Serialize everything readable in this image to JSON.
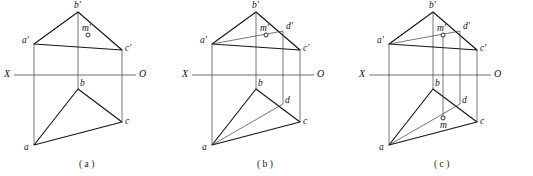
{
  "figure": {
    "background_color": "#ffffff",
    "edge_color": "#161616",
    "projection_line_color": "#4a4a4a",
    "axis_color": "#6f6f6f",
    "width": 533,
    "height": 176
  },
  "axis": {
    "left_label": "X",
    "right_label": "O",
    "y": 75
  },
  "panels": [
    {
      "id": "a",
      "caption": "( a )",
      "caption_x": 79,
      "caption_y": 160,
      "origin_x": 0,
      "axis_x1": 14,
      "axis_x2": 136,
      "axis_left_label_x": 4,
      "axis_right_label_x": 139,
      "vertices": {
        "b_prime": {
          "label": "b'",
          "x": 78,
          "y": 12,
          "lx": 74,
          "ly": 1
        },
        "a_prime": {
          "label": "a'",
          "x": 34,
          "y": 44,
          "lx": 22,
          "ly": 36
        },
        "c_prime": {
          "label": "c'",
          "x": 122,
          "y": 50,
          "lx": 125,
          "ly": 44
        },
        "b": {
          "label": "b",
          "x": 78,
          "y": 89,
          "lx": 80,
          "ly": 79
        },
        "a": {
          "label": "a",
          "x": 34,
          "y": 145,
          "lx": 24,
          "ly": 143
        },
        "c": {
          "label": "c",
          "x": 122,
          "y": 122,
          "lx": 125,
          "ly": 117
        }
      },
      "extra_points": {
        "m_prime": {
          "label": "m'",
          "x": 88,
          "y": 35,
          "r": 2.0,
          "lx": 82,
          "ly": 24
        }
      },
      "has_d": false,
      "has_m_lower": false,
      "has_ad_line": false,
      "has_m_projector": false
    },
    {
      "id": "b",
      "caption": "( b )",
      "caption_x": 257,
      "caption_y": 160,
      "origin_x": 178,
      "axis_x1": 14,
      "axis_x2": 136,
      "axis_left_label_x": 4,
      "axis_right_label_x": 139,
      "vertices": {
        "b_prime": {
          "label": "b'",
          "x": 78,
          "y": 12,
          "lx": 74,
          "ly": 1
        },
        "a_prime": {
          "label": "a'",
          "x": 34,
          "y": 44,
          "lx": 22,
          "ly": 36
        },
        "c_prime": {
          "label": "c'",
          "x": 122,
          "y": 50,
          "lx": 125,
          "ly": 44
        },
        "b": {
          "label": "b",
          "x": 78,
          "y": 89,
          "lx": 80,
          "ly": 79
        },
        "a": {
          "label": "a",
          "x": 34,
          "y": 145,
          "lx": 24,
          "ly": 143
        },
        "c": {
          "label": "c",
          "x": 122,
          "y": 122,
          "lx": 125,
          "ly": 117
        }
      },
      "extra_points": {
        "m_prime": {
          "label": "m'",
          "x": 88,
          "y": 35,
          "r": 2.0,
          "lx": 82,
          "ly": 24
        },
        "d_prime": {
          "label": "d'",
          "x": 105,
          "y": 31,
          "lx": 108,
          "ly": 22
        },
        "d": {
          "label": "d",
          "x": 105,
          "y": 104,
          "lx": 107,
          "ly": 96
        }
      },
      "has_d": true,
      "has_m_lower": false,
      "has_ad_line": true,
      "has_m_projector": false
    },
    {
      "id": "c",
      "caption": "( c )",
      "caption_x": 434,
      "caption_y": 160,
      "origin_x": 355,
      "axis_x1": 14,
      "axis_x2": 136,
      "axis_left_label_x": 4,
      "axis_right_label_x": 139,
      "vertices": {
        "b_prime": {
          "label": "b'",
          "x": 78,
          "y": 12,
          "lx": 74,
          "ly": 1
        },
        "a_prime": {
          "label": "a'",
          "x": 34,
          "y": 44,
          "lx": 22,
          "ly": 36
        },
        "c_prime": {
          "label": "c'",
          "x": 122,
          "y": 50,
          "lx": 125,
          "ly": 44
        },
        "b": {
          "label": "b",
          "x": 78,
          "y": 89,
          "lx": 80,
          "ly": 79
        },
        "a": {
          "label": "a",
          "x": 34,
          "y": 145,
          "lx": 24,
          "ly": 143
        },
        "c": {
          "label": "c",
          "x": 122,
          "y": 122,
          "lx": 125,
          "ly": 117
        }
      },
      "extra_points": {
        "m_prime": {
          "label": "m'",
          "x": 88,
          "y": 35,
          "r": 2.0,
          "lx": 82,
          "ly": 24
        },
        "d_prime": {
          "label": "d'",
          "x": 105,
          "y": 31,
          "lx": 108,
          "ly": 22
        },
        "d": {
          "label": "d",
          "x": 105,
          "y": 104,
          "lx": 107,
          "ly": 96
        },
        "m": {
          "label": "m",
          "x": 88,
          "y": 118,
          "r": 2.0,
          "lx": 85,
          "ly": 121
        }
      },
      "has_d": true,
      "has_m_lower": true,
      "has_ad_line": true,
      "has_m_projector": true
    }
  ]
}
